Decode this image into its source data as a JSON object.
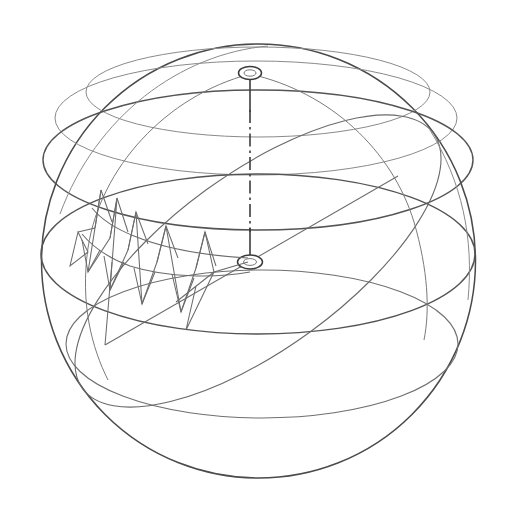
{
  "figure": {
    "kind": "technical-line-drawing",
    "background_color": "#ffffff",
    "line_color": "#6b6b6b",
    "outline_color": "#4a4a4a",
    "axis_color": "#3d3d3d",
    "canvas": {
      "width": 526,
      "height": 516
    }
  },
  "geometry": {
    "sphere": {
      "center_x": 258,
      "center_y": 261,
      "radius": 217,
      "left_edge_x": 42,
      "right_edge_x": 475,
      "top_edge_y": 42,
      "bottom_edge_y": 480
    },
    "north_pole_marker": {
      "cx": 250,
      "cy": 73,
      "rx": 11,
      "ry": 6.5
    },
    "center_marker": {
      "cx": 250,
      "cy": 262,
      "rx": 12,
      "ry": 7
    },
    "polar_axis": {
      "x": 250,
      "y_top": 73,
      "y_bottom": 262,
      "style": "dash-dot"
    },
    "latitude_circles": [
      {
        "name": "arctic-circle",
        "cy": 88,
        "rx": 178,
        "ry": 46,
        "weight": "faint"
      },
      {
        "name": "tropic-upper",
        "cy": 120,
        "rx": 208,
        "ry": 58,
        "weight": "faint"
      },
      {
        "name": "tropic-of-cancer",
        "cy": 160,
        "rx": 216,
        "ry": 70,
        "weight": "strong"
      },
      {
        "name": "equator",
        "cy": 252,
        "rx": 217,
        "ry": 78,
        "weight": "strong"
      },
      {
        "name": "tropic-of-capricorn",
        "cy": 340,
        "rx": 196,
        "ry": 72,
        "weight": "normal"
      }
    ],
    "great_circle_tilted": {
      "name": "ecliptic",
      "tilt_deg": -38
    },
    "meridian_arc": {
      "name": "prime-meridian",
      "from": "north-pole",
      "to": "lower-left-limb"
    },
    "radius_line": {
      "x1": 105,
      "y1": 345,
      "x2": 395,
      "y2": 178
    },
    "barb_track": {
      "name": "arrow-barb-chain",
      "spike_count": 9,
      "direction": "from-center-toward-upper-left"
    }
  }
}
